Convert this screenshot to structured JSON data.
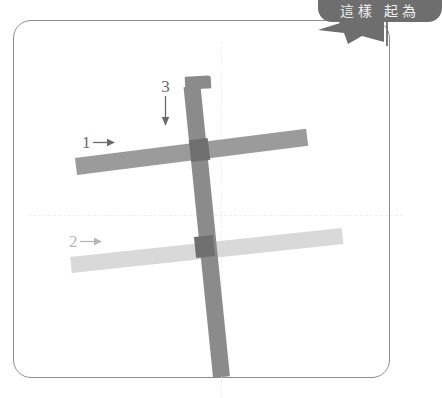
{
  "character": {
    "glyph": "干",
    "stroke_count": 3
  },
  "frame": {
    "name": "practice-grid",
    "border_color": "#8d8d8d",
    "guide_color": "#f0eef0"
  },
  "strokes": [
    {
      "number": "1",
      "order": 1,
      "type": "horizontal",
      "direction": "left-to-right",
      "color": "#9b9b9b",
      "arrow": "arrow-right"
    },
    {
      "number": "2",
      "order": 2,
      "type": "horizontal",
      "direction": "left-to-right",
      "color": "#d9d9d9",
      "arrow": "arrow-right"
    },
    {
      "number": "3",
      "order": 3,
      "type": "vertical",
      "direction": "top-to-bottom",
      "color": "#8b8b8b",
      "arrow": "arrow-down"
    }
  ],
  "speech_bubble": {
    "text": "這樣  起為",
    "background": "#6e6e6e",
    "text_color": "#f2f2f2"
  }
}
